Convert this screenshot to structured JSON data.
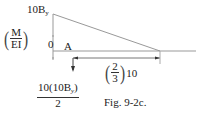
{
  "diagram": {
    "type": "moment_diagram",
    "peak_label": {
      "main": "10B",
      "subscript": "y"
    },
    "axis_label": {
      "numerator": "M",
      "denominator": "EI"
    },
    "zero_label": "0",
    "point_label": "A",
    "centroid_distance": {
      "frac_num": "2",
      "frac_den": "3",
      "multiplier": "10"
    },
    "resultant_area": {
      "numerator_main": "10(10B",
      "numerator_sub": "y",
      "numerator_close": ")",
      "denominator": "2"
    },
    "caption": "Fig. 9-2c.",
    "colors": {
      "line": "#888888",
      "text": "#222222"
    }
  }
}
